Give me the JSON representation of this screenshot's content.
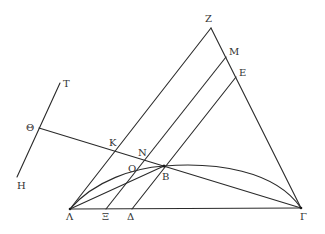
{
  "diagram": {
    "type": "geometric-construction",
    "colors": {
      "stroke": "#2a2a2a",
      "label": "#333333",
      "background": "#ffffff"
    },
    "points": {
      "Z": {
        "label": "Z",
        "x": 211,
        "y": 28,
        "lx": 205,
        "ly": 22
      },
      "M": {
        "label": "M",
        "x": 226,
        "y": 57,
        "lx": 229,
        "ly": 55
      },
      "E": {
        "label": "E",
        "x": 236,
        "y": 77,
        "lx": 239,
        "ly": 76
      },
      "T": {
        "label": "T",
        "x": 60,
        "y": 83,
        "lx": 63,
        "ly": 87
      },
      "Theta": {
        "label": "Θ",
        "x": 39,
        "y": 128,
        "lx": 26,
        "ly": 131
      },
      "H": {
        "label": "H",
        "x": 17,
        "y": 177,
        "lx": 17,
        "ly": 189
      },
      "K": {
        "label": "K",
        "x": 114,
        "y": 151,
        "lx": 109,
        "ly": 146
      },
      "N": {
        "label": "N",
        "x": 144,
        "y": 161,
        "lx": 138,
        "ly": 156
      },
      "O": {
        "label": "O",
        "x": 130,
        "y": 172,
        "lx": 128,
        "ly": 172
      },
      "B": {
        "label": "B",
        "x": 164,
        "y": 166,
        "lx": 162,
        "ly": 180
      },
      "Lambda": {
        "label": "Λ",
        "x": 70,
        "y": 209,
        "lx": 66,
        "ly": 220
      },
      "Xi": {
        "label": "Ξ",
        "x": 106,
        "y": 209,
        "lx": 102,
        "ly": 220
      },
      "Delta": {
        "label": "Δ",
        "x": 132,
        "y": 209,
        "lx": 127,
        "ly": 220
      },
      "Gamma": {
        "label": "Γ",
        "x": 301,
        "y": 208,
        "lx": 300,
        "ly": 220
      }
    }
  }
}
